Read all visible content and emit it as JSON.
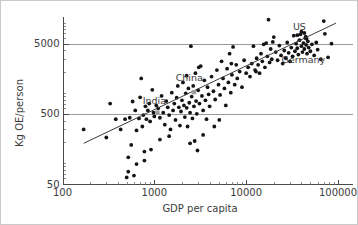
{
  "figure": {
    "name": "energy-use-vs-gdp-scatter",
    "background": "#ffffff",
    "border_color": "#c9c9c9"
  },
  "chart_data": {
    "type": "scatter",
    "title": "",
    "subtitle": "",
    "xlabel": "GDP per capita",
    "ylabel": "Kg OE/person",
    "xscale": "log",
    "yscale": "log",
    "xlim": [
      100,
      100000
    ],
    "ylim": [
      50,
      12000
    ],
    "xticks": [
      100,
      1000,
      10000,
      100000
    ],
    "xtick_labels": [
      "100",
      "1000",
      "10000",
      "100000"
    ],
    "yticks": [
      50,
      500,
      5000
    ],
    "ytick_labels": [
      "50",
      "500",
      "5000"
    ],
    "grid": "horizontal-major-only",
    "gridlines_y": [
      500,
      5000
    ],
    "legend": "none",
    "legend_position": "none",
    "minor_ticks": true,
    "marker_color": "#141414",
    "highlight_color": "#9c9c9c",
    "trendline_color": "#3a3a3a",
    "gridline_color": "#9a9a9a",
    "trendline": {
      "type": "linear-in-log-log",
      "x_start": 170,
      "y_start": 190,
      "x_end": 95000,
      "y_end": 9800
    },
    "annotations": [
      {
        "label": "US",
        "x": 38000,
        "y": 7800,
        "marker": false
      },
      {
        "label": "Germany",
        "x": 42000,
        "y": 2650,
        "marker": false
      },
      {
        "label": "China",
        "x": 2400,
        "y": 1450,
        "marker": false
      },
      {
        "label": "India",
        "x": 1000,
        "y": 700,
        "marker": false
      }
    ],
    "highlight_points": [
      {
        "label": "China",
        "x": 2700,
        "y": 1020
      },
      {
        "label": "India",
        "x": 1080,
        "y": 520
      }
    ],
    "points": [
      {
        "x": 170,
        "y": 300
      },
      {
        "x": 300,
        "y": 230
      },
      {
        "x": 330,
        "y": 700
      },
      {
        "x": 380,
        "y": 420
      },
      {
        "x": 430,
        "y": 300
      },
      {
        "x": 480,
        "y": 420
      },
      {
        "x": 500,
        "y": 62
      },
      {
        "x": 520,
        "y": 75
      },
      {
        "x": 520,
        "y": 120
      },
      {
        "x": 540,
        "y": 440
      },
      {
        "x": 560,
        "y": 180
      },
      {
        "x": 580,
        "y": 750
      },
      {
        "x": 600,
        "y": 66
      },
      {
        "x": 620,
        "y": 560
      },
      {
        "x": 640,
        "y": 290
      },
      {
        "x": 680,
        "y": 430
      },
      {
        "x": 700,
        "y": 860
      },
      {
        "x": 720,
        "y": 1600
      },
      {
        "x": 740,
        "y": 330
      },
      {
        "x": 760,
        "y": 480
      },
      {
        "x": 780,
        "y": 145
      },
      {
        "x": 800,
        "y": 640
      },
      {
        "x": 820,
        "y": 420
      },
      {
        "x": 850,
        "y": 560
      },
      {
        "x": 880,
        "y": 700
      },
      {
        "x": 900,
        "y": 390
      },
      {
        "x": 920,
        "y": 155
      },
      {
        "x": 950,
        "y": 1100
      },
      {
        "x": 980,
        "y": 520
      },
      {
        "x": 1000,
        "y": 460
      },
      {
        "x": 1050,
        "y": 660
      },
      {
        "x": 1100,
        "y": 600
      },
      {
        "x": 1150,
        "y": 440
      },
      {
        "x": 1200,
        "y": 900
      },
      {
        "x": 1250,
        "y": 520
      },
      {
        "x": 1300,
        "y": 350
      },
      {
        "x": 1350,
        "y": 760
      },
      {
        "x": 1400,
        "y": 620
      },
      {
        "x": 1450,
        "y": 480
      },
      {
        "x": 1500,
        "y": 300
      },
      {
        "x": 1550,
        "y": 1000
      },
      {
        "x": 1600,
        "y": 560
      },
      {
        "x": 1650,
        "y": 700
      },
      {
        "x": 1700,
        "y": 410
      },
      {
        "x": 1750,
        "y": 850
      },
      {
        "x": 1800,
        "y": 1250
      },
      {
        "x": 1850,
        "y": 620
      },
      {
        "x": 1900,
        "y": 340
      },
      {
        "x": 1950,
        "y": 540
      },
      {
        "x": 2000,
        "y": 780
      },
      {
        "x": 2050,
        "y": 1400
      },
      {
        "x": 2100,
        "y": 660
      },
      {
        "x": 2150,
        "y": 450
      },
      {
        "x": 2200,
        "y": 980
      },
      {
        "x": 2250,
        "y": 610
      },
      {
        "x": 2300,
        "y": 330
      },
      {
        "x": 2350,
        "y": 1150
      },
      {
        "x": 2400,
        "y": 720
      },
      {
        "x": 2450,
        "y": 520
      },
      {
        "x": 2500,
        "y": 4600
      },
      {
        "x": 2550,
        "y": 880
      },
      {
        "x": 2600,
        "y": 430
      },
      {
        "x": 2650,
        "y": 1250
      },
      {
        "x": 2700,
        "y": 640
      },
      {
        "x": 2750,
        "y": 205
      },
      {
        "x": 2800,
        "y": 1900
      },
      {
        "x": 2850,
        "y": 760
      },
      {
        "x": 2900,
        "y": 500
      },
      {
        "x": 2950,
        "y": 150
      },
      {
        "x": 3000,
        "y": 1080
      },
      {
        "x": 3100,
        "y": 700
      },
      {
        "x": 3200,
        "y": 2400
      },
      {
        "x": 3300,
        "y": 900
      },
      {
        "x": 3400,
        "y": 560
      },
      {
        "x": 3500,
        "y": 1500
      },
      {
        "x": 3600,
        "y": 780
      },
      {
        "x": 3700,
        "y": 420
      },
      {
        "x": 3800,
        "y": 1200
      },
      {
        "x": 3900,
        "y": 950
      },
      {
        "x": 4000,
        "y": 640
      },
      {
        "x": 4200,
        "y": 1700
      },
      {
        "x": 4400,
        "y": 1050
      },
      {
        "x": 4600,
        "y": 800
      },
      {
        "x": 4800,
        "y": 2100
      },
      {
        "x": 5000,
        "y": 1300
      },
      {
        "x": 5200,
        "y": 930
      },
      {
        "x": 5400,
        "y": 2800
      },
      {
        "x": 5600,
        "y": 1600
      },
      {
        "x": 5800,
        "y": 1150
      },
      {
        "x": 6000,
        "y": 660
      },
      {
        "x": 6200,
        "y": 2200
      },
      {
        "x": 6400,
        "y": 1400
      },
      {
        "x": 6600,
        "y": 3600
      },
      {
        "x": 6800,
        "y": 1000
      },
      {
        "x": 7000,
        "y": 1800
      },
      {
        "x": 7200,
        "y": 4500
      },
      {
        "x": 7500,
        "y": 1300
      },
      {
        "x": 7800,
        "y": 2500
      },
      {
        "x": 8000,
        "y": 1600
      },
      {
        "x": 8500,
        "y": 2000
      },
      {
        "x": 9000,
        "y": 1200
      },
      {
        "x": 9500,
        "y": 2900
      },
      {
        "x": 10000,
        "y": 1900
      },
      {
        "x": 10500,
        "y": 2300
      },
      {
        "x": 11000,
        "y": 1700
      },
      {
        "x": 11500,
        "y": 2600
      },
      {
        "x": 12000,
        "y": 4600
      },
      {
        "x": 12500,
        "y": 2100
      },
      {
        "x": 13000,
        "y": 3100
      },
      {
        "x": 13500,
        "y": 2500
      },
      {
        "x": 14000,
        "y": 1900
      },
      {
        "x": 14500,
        "y": 3600
      },
      {
        "x": 15000,
        "y": 2800
      },
      {
        "x": 15500,
        "y": 4900
      },
      {
        "x": 16000,
        "y": 2300
      },
      {
        "x": 16500,
        "y": 5100
      },
      {
        "x": 17000,
        "y": 3300
      },
      {
        "x": 17500,
        "y": 11000
      },
      {
        "x": 18000,
        "y": 2700
      },
      {
        "x": 18500,
        "y": 4200
      },
      {
        "x": 19000,
        "y": 3000
      },
      {
        "x": 20000,
        "y": 6200
      },
      {
        "x": 21000,
        "y": 3800
      },
      {
        "x": 22000,
        "y": 2900
      },
      {
        "x": 23000,
        "y": 4700
      },
      {
        "x": 24000,
        "y": 3400
      },
      {
        "x": 25000,
        "y": 2600
      },
      {
        "x": 26000,
        "y": 4000
      },
      {
        "x": 27000,
        "y": 3100
      },
      {
        "x": 28000,
        "y": 5200
      },
      {
        "x": 29000,
        "y": 3700
      },
      {
        "x": 30000,
        "y": 2800
      },
      {
        "x": 31000,
        "y": 4400
      },
      {
        "x": 32000,
        "y": 3300
      },
      {
        "x": 33000,
        "y": 6500
      },
      {
        "x": 34000,
        "y": 3900
      },
      {
        "x": 35000,
        "y": 5000
      },
      {
        "x": 36000,
        "y": 4300
      },
      {
        "x": 37000,
        "y": 3500
      },
      {
        "x": 38000,
        "y": 5600
      },
      {
        "x": 39000,
        "y": 6800
      },
      {
        "x": 40000,
        "y": 4600
      },
      {
        "x": 41000,
        "y": 3800
      },
      {
        "x": 42000,
        "y": 5100
      },
      {
        "x": 43000,
        "y": 4200
      },
      {
        "x": 44000,
        "y": 6000
      },
      {
        "x": 45000,
        "y": 4800
      },
      {
        "x": 46000,
        "y": 3600
      },
      {
        "x": 47000,
        "y": 5400
      },
      {
        "x": 48000,
        "y": 4400
      },
      {
        "x": 50000,
        "y": 3900
      },
      {
        "x": 52000,
        "y": 4900
      },
      {
        "x": 55000,
        "y": 3400
      },
      {
        "x": 58000,
        "y": 5200
      },
      {
        "x": 60000,
        "y": 4100
      },
      {
        "x": 65000,
        "y": 3000
      },
      {
        "x": 70000,
        "y": 10500
      },
      {
        "x": 72000,
        "y": 6900
      },
      {
        "x": 78000,
        "y": 3200
      },
      {
        "x": 85000,
        "y": 5000
      },
      {
        "x": 40000,
        "y": 7400
      },
      {
        "x": 43000,
        "y": 7100
      },
      {
        "x": 44500,
        "y": 6300
      },
      {
        "x": 45500,
        "y": 5900
      },
      {
        "x": 36000,
        "y": 6600
      },
      {
        "x": 19500,
        "y": 5300
      },
      {
        "x": 12800,
        "y": 2000
      },
      {
        "x": 3050,
        "y": 2300
      },
      {
        "x": 2250,
        "y": 1750
      },
      {
        "x": 6900,
        "y": 2600
      },
      {
        "x": 4500,
        "y": 330
      },
      {
        "x": 5100,
        "y": 410
      },
      {
        "x": 3400,
        "y": 250
      },
      {
        "x": 2450,
        "y": 190
      },
      {
        "x": 1450,
        "y": 240
      },
      {
        "x": 1150,
        "y": 215
      },
      {
        "x": 780,
        "y": 108
      },
      {
        "x": 640,
        "y": 96
      }
    ]
  },
  "labels": {
    "xaxis_title": "GDP per capita",
    "yaxis_title": "Kg OE/person",
    "x_100": "100",
    "x_1000": "1000",
    "x_10000": "10000",
    "x_100000": "100000",
    "y_50": "50",
    "y_500": "500",
    "y_5000": "5000",
    "us": "US",
    "germany": "Germany",
    "china": "China",
    "india": "India"
  }
}
